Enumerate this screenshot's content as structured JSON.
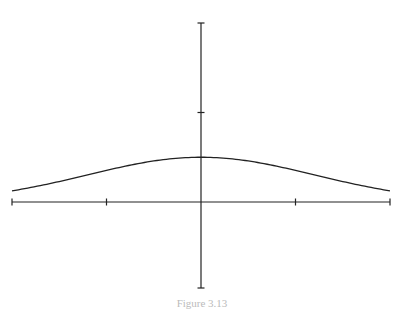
{
  "chart_data": {
    "type": "line",
    "title": "",
    "xlabel": "",
    "ylabel": "",
    "xlim": [
      -2,
      2
    ],
    "ylim": [
      -1,
      2
    ],
    "x_ticks": [
      -2,
      -1,
      0,
      1,
      2
    ],
    "y_ticks": [
      2,
      1,
      0,
      -1
    ],
    "tick_labels_shown": false,
    "grid": false,
    "legend": "none",
    "series": [
      {
        "name": "bell-curve",
        "function": "gaussian",
        "peak": 0.5,
        "center": 0,
        "sigma": 1.2,
        "x": [
          -2,
          -1.5,
          -1,
          -0.5,
          0,
          0.5,
          1,
          1.5,
          2
        ],
        "values": [
          0.13,
          0.2,
          0.34,
          0.46,
          0.5,
          0.46,
          0.34,
          0.2,
          0.14
        ]
      }
    ]
  },
  "caption": "Figure 3.13"
}
